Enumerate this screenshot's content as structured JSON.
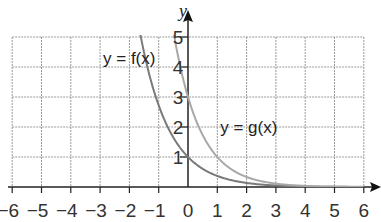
{
  "chart_data": {
    "type": "line",
    "title": "",
    "xlabel": "x",
    "ylabel": "y",
    "xlim": [
      -6,
      6
    ],
    "ylim": [
      0,
      5
    ],
    "grid": true,
    "x_ticks": [
      "−6",
      "−5",
      "−4",
      "−3",
      "−2",
      "−1",
      "0",
      "1",
      "2",
      "3",
      "4",
      "5",
      "6"
    ],
    "y_ticks": [
      "1",
      "2",
      "3",
      "4",
      "5"
    ],
    "series": [
      {
        "name": "y = f(x)",
        "label_parts": [
          "y",
          " = ",
          "f",
          "(",
          "x",
          ")"
        ],
        "color": "#7a7a7a",
        "points": [
          [
            -1.7,
            5
          ],
          [
            -1.5,
            4.48
          ],
          [
            -1,
            2.72
          ],
          [
            -0.5,
            1.65
          ],
          [
            0,
            1
          ],
          [
            0.5,
            0.61
          ],
          [
            1,
            0.37
          ],
          [
            2,
            0.14
          ],
          [
            3,
            0.05
          ],
          [
            4,
            0.02
          ],
          [
            5,
            0.01
          ],
          [
            6,
            0.0
          ]
        ]
      },
      {
        "name": "y = g(x)",
        "label_parts": [
          "y",
          " = ",
          "g",
          "(",
          "x",
          ")"
        ],
        "color": "#a8a8a8",
        "points": [
          [
            -0.47,
            5
          ],
          [
            0,
            3
          ],
          [
            0.5,
            1.73
          ],
          [
            1,
            1
          ],
          [
            1.5,
            0.58
          ],
          [
            2,
            0.33
          ],
          [
            3,
            0.11
          ],
          [
            4,
            0.04
          ],
          [
            5,
            0.01
          ],
          [
            6,
            0.0
          ]
        ]
      }
    ],
    "annotations": [
      {
        "text": "y = f(x)",
        "x": -2.9,
        "y": 4.1
      },
      {
        "text": "y = g(x)",
        "x": 1.1,
        "y": 1.8
      }
    ]
  }
}
